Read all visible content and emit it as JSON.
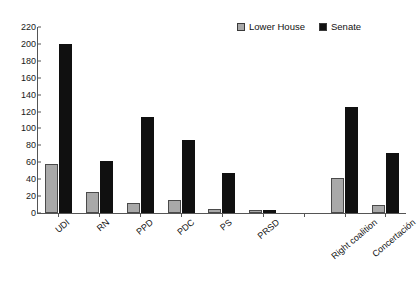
{
  "chart_data": {
    "type": "bar",
    "title": "",
    "xlabel": "",
    "ylabel": "",
    "ylim": [
      0,
      220
    ],
    "ytick_step": 20,
    "grid": false,
    "legend_position": "top-right",
    "categories": [
      "UDI",
      "RN",
      "PPD",
      "PDC",
      "PS",
      "PRSD",
      "",
      "Right coalition",
      "Concertación"
    ],
    "yticks": [
      "0",
      "20",
      "40",
      "60",
      "80",
      "100",
      "120",
      "140",
      "160",
      "180",
      "200",
      "220"
    ],
    "series": [
      {
        "name": "Lower House",
        "color": "#a9a9a9",
        "values": [
          58,
          25,
          12,
          15,
          5,
          4,
          0,
          41,
          10
        ]
      },
      {
        "name": "Senate",
        "color": "#101010",
        "values": [
          200,
          62,
          113,
          86,
          47,
          4,
          0,
          125,
          71
        ]
      }
    ]
  },
  "legend": {
    "items": [
      {
        "label": "Lower House",
        "swatch": "gray-square-swatch"
      },
      {
        "label": "Senate",
        "swatch": "black-square-swatch"
      }
    ]
  }
}
